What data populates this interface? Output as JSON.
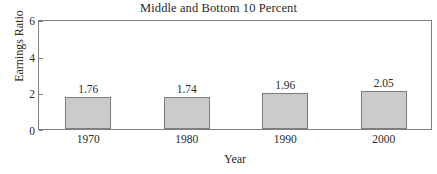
{
  "chart_data": {
    "type": "bar",
    "title": "Middle and Bottom 10 Percent",
    "xlabel": "Year",
    "ylabel": "Earnings Ratio",
    "categories": [
      "1970",
      "1980",
      "1990",
      "2000"
    ],
    "values": [
      1.76,
      1.74,
      1.96,
      2.05
    ],
    "data_labels": [
      "1.76",
      "1.74",
      "1.96",
      "2.05"
    ],
    "ylim": [
      0,
      6
    ],
    "yticks": [
      0,
      2,
      4,
      6
    ],
    "ytick_labels": [
      "0",
      "2",
      "4",
      "6"
    ],
    "grid": false,
    "legend": false,
    "bar_fill_color": "#cbcbcb",
    "bar_border_color": "#7d7d7d",
    "axis_color": "#808080",
    "background_color": "#ffffff",
    "text_color": "#2b2b2b"
  }
}
